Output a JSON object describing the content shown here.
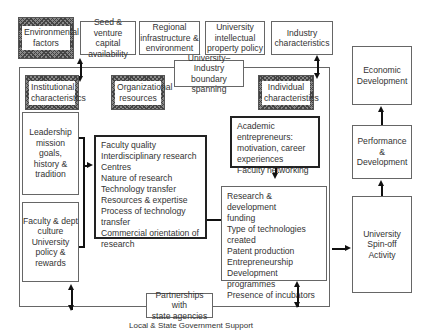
{
  "top": {
    "environmental_factors": [
      "Environmental",
      "factors"
    ],
    "seed_venture": [
      "Seed & venture",
      "capital",
      "availability"
    ],
    "regional": [
      "Regional",
      "infrastructure &",
      "environment"
    ],
    "ip_policy": [
      "University",
      "intellectual",
      "property  policy"
    ],
    "industry": [
      "Industry",
      "characteristics"
    ]
  },
  "middle": {
    "boundary_spanning": [
      "University–Industry",
      "boundary spanning"
    ],
    "institutional": [
      "Institutional",
      "characteristics"
    ],
    "organizational": [
      "Organizational",
      "resources"
    ],
    "individual": [
      "Individual",
      "characteristics"
    ],
    "leadership": [
      "Leadership",
      "mission",
      "goals,",
      "history &",
      "tradition"
    ],
    "faculty_culture": [
      "Faculty & dept",
      "culture",
      "University",
      "policy &",
      "rewards"
    ],
    "org_resources_list": [
      "Faculty quality",
      "Interdisciplinary research",
      "Centres",
      "Nature of research",
      "Technology transfer",
      "Resources & expertise",
      "Process of technology",
      "transfer",
      "Commercial orientation of",
      "research"
    ],
    "academic_entrepreneurs": [
      "Academic entrepreneurs:",
      "motivation, career",
      "experiences",
      "Faculty networking"
    ],
    "rd_list": [
      "Research & development",
      "funding",
      "Type of technologies created",
      "Patent production",
      "Entrepreneurship",
      "Development programmes",
      "Presence of incubators"
    ]
  },
  "right": {
    "economic": [
      "Economic",
      "Development"
    ],
    "performance": [
      "Performance",
      "&",
      "Development"
    ],
    "spinoff": [
      "University",
      "Spin-off",
      "Activity"
    ]
  },
  "bottom": {
    "partnerships": [
      "Partnerships with",
      "state agencies"
    ],
    "caption": "Local & State Government Support"
  }
}
